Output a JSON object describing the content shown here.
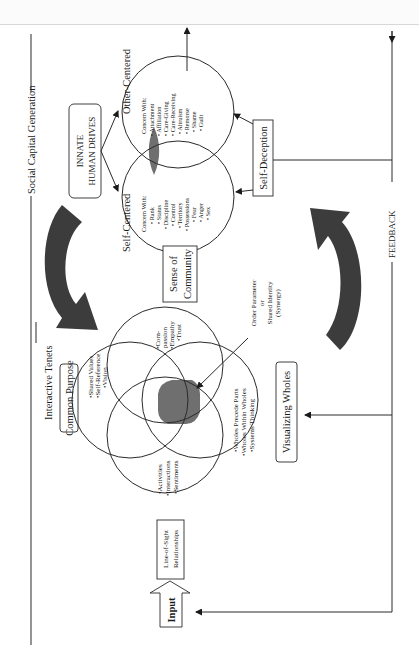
{
  "figure": {
    "outer_label": "Social Capital Generation",
    "feedback_label": "FEEDBACK",
    "innate_drives": {
      "title_line1": "INNATE",
      "title_line2": "HUMAN DRIVES",
      "self_centered": {
        "label": "Self-Centered",
        "header": "Concern With:",
        "items": [
          "Rank",
          "Status",
          "Discipline",
          "Control",
          "Territory",
          "Possessions",
          "Fear",
          "Anger",
          "Sex"
        ]
      },
      "other_centered": {
        "label": "Other-Centered",
        "header": "Concern With:",
        "items": [
          "Attachment",
          "Affiliation",
          "Care-Giving",
          "Care-Receiving",
          "Altruism",
          "Remorse",
          "Shame",
          "Guilt"
        ]
      },
      "self_deception": "Self-Deception"
    },
    "sense_of_community": {
      "line1": "Sense of",
      "line2": "Community"
    },
    "interactive_tenets": {
      "title": "Interactive Tenets",
      "common_purpose": "Common Purpose",
      "common_purpose_items": [
        "Shared Values",
        "Self-Reference",
        "Vision"
      ],
      "compassion_items": [
        "Com-",
        "passion",
        "Empathy",
        "Trust"
      ],
      "line_of_sight_items": [
        "Activities",
        "Interactions",
        "Sentiments"
      ],
      "visualizing_items": [
        "Wholes Precede Parts",
        "Wholes Within Wholes",
        "Systems Thinking"
      ],
      "visualizing_wholes": "Visualizing Wholes",
      "order_parameter": {
        "line1": "Order Parameter",
        "line2": "or",
        "line3": "Shared Identity",
        "line4": "(Synergy)"
      }
    },
    "line_of_sight": {
      "line1": "Line-of-Sight",
      "line2": "Relationships"
    },
    "input_label": "Input",
    "colors": {
      "shade": "#6f6f6f",
      "arrow": "#3c3c3c",
      "line": "#2a2a2a"
    }
  }
}
